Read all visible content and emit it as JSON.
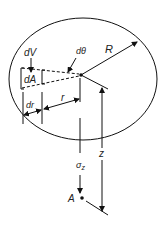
{
  "diagram": {
    "type": "circular-loaded-area-stress",
    "labels": {
      "dV": "dV",
      "dA": "dA",
      "dtheta": "dθ",
      "R": "R",
      "dr": "dr",
      "r": "r",
      "z": "z",
      "sigma": "σ",
      "sigma_sub": "z",
      "A": "A"
    },
    "colors": {
      "line": "#111111",
      "text": "#222222",
      "background": "#ffffff"
    }
  }
}
